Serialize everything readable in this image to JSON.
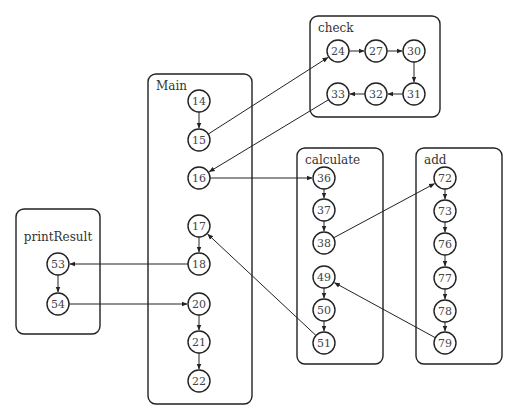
{
  "diagram": {
    "type": "call-graph",
    "boxes": [
      {
        "id": "check",
        "label": "check",
        "x": 310,
        "y": 16,
        "w": 130,
        "h": 101
      },
      {
        "id": "main",
        "label": "Main",
        "x": 148,
        "y": 74,
        "w": 104,
        "h": 330
      },
      {
        "id": "calculate",
        "label": "calculate",
        "x": 297,
        "y": 148,
        "w": 86,
        "h": 216
      },
      {
        "id": "add",
        "label": "add",
        "x": 416,
        "y": 148,
        "w": 86,
        "h": 216
      },
      {
        "id": "printResult",
        "label": "printResult",
        "x": 16,
        "y": 209,
        "w": 84,
        "h": 125
      }
    ],
    "nodes": [
      {
        "id": "24",
        "box": "check",
        "x": 338,
        "y": 51
      },
      {
        "id": "27",
        "box": "check",
        "x": 376,
        "y": 51
      },
      {
        "id": "30",
        "box": "check",
        "x": 414,
        "y": 51
      },
      {
        "id": "31",
        "box": "check",
        "x": 414,
        "y": 94
      },
      {
        "id": "32",
        "box": "check",
        "x": 376,
        "y": 94
      },
      {
        "id": "33",
        "box": "check",
        "x": 338,
        "y": 94
      },
      {
        "id": "14",
        "box": "main",
        "x": 199,
        "y": 101
      },
      {
        "id": "15",
        "box": "main",
        "x": 199,
        "y": 140
      },
      {
        "id": "16",
        "box": "main",
        "x": 199,
        "y": 178
      },
      {
        "id": "17",
        "box": "main",
        "x": 199,
        "y": 226
      },
      {
        "id": "18",
        "box": "main",
        "x": 199,
        "y": 264
      },
      {
        "id": "20",
        "box": "main",
        "x": 199,
        "y": 304
      },
      {
        "id": "21",
        "box": "main",
        "x": 199,
        "y": 342
      },
      {
        "id": "22",
        "box": "main",
        "x": 199,
        "y": 381
      },
      {
        "id": "36",
        "box": "calculate",
        "x": 324,
        "y": 178
      },
      {
        "id": "37",
        "box": "calculate",
        "x": 324,
        "y": 210
      },
      {
        "id": "38",
        "box": "calculate",
        "x": 324,
        "y": 243
      },
      {
        "id": "49",
        "box": "calculate",
        "x": 324,
        "y": 277
      },
      {
        "id": "50",
        "box": "calculate",
        "x": 324,
        "y": 310
      },
      {
        "id": "51",
        "box": "calculate",
        "x": 324,
        "y": 343
      },
      {
        "id": "72",
        "box": "add",
        "x": 445,
        "y": 178
      },
      {
        "id": "73",
        "box": "add",
        "x": 445,
        "y": 211
      },
      {
        "id": "76",
        "box": "add",
        "x": 445,
        "y": 244
      },
      {
        "id": "77",
        "box": "add",
        "x": 445,
        "y": 278
      },
      {
        "id": "78",
        "box": "add",
        "x": 445,
        "y": 311
      },
      {
        "id": "79",
        "box": "add",
        "x": 445,
        "y": 343
      },
      {
        "id": "53",
        "box": "printResult",
        "x": 58,
        "y": 264
      },
      {
        "id": "54",
        "box": "printResult",
        "x": 58,
        "y": 304
      }
    ],
    "edges": [
      {
        "from": "14",
        "to": "15"
      },
      {
        "from": "15",
        "to": "24"
      },
      {
        "from": "24",
        "to": "27"
      },
      {
        "from": "27",
        "to": "30"
      },
      {
        "from": "30",
        "to": "31"
      },
      {
        "from": "31",
        "to": "32"
      },
      {
        "from": "32",
        "to": "33"
      },
      {
        "from": "33",
        "to": "16"
      },
      {
        "from": "16",
        "to": "36"
      },
      {
        "from": "36",
        "to": "37"
      },
      {
        "from": "37",
        "to": "38"
      },
      {
        "from": "38",
        "to": "72"
      },
      {
        "from": "72",
        "to": "73"
      },
      {
        "from": "73",
        "to": "76"
      },
      {
        "from": "76",
        "to": "77"
      },
      {
        "from": "77",
        "to": "78"
      },
      {
        "from": "78",
        "to": "79"
      },
      {
        "from": "79",
        "to": "49"
      },
      {
        "from": "49",
        "to": "50"
      },
      {
        "from": "50",
        "to": "51"
      },
      {
        "from": "51",
        "to": "17"
      },
      {
        "from": "17",
        "to": "18"
      },
      {
        "from": "18",
        "to": "53"
      },
      {
        "from": "53",
        "to": "54"
      },
      {
        "from": "54",
        "to": "20"
      },
      {
        "from": "20",
        "to": "21"
      },
      {
        "from": "21",
        "to": "22"
      }
    ],
    "style": {
      "stroke": "#222222",
      "node_radius": 11,
      "box_radius": 8,
      "background": "#ffffff"
    }
  }
}
